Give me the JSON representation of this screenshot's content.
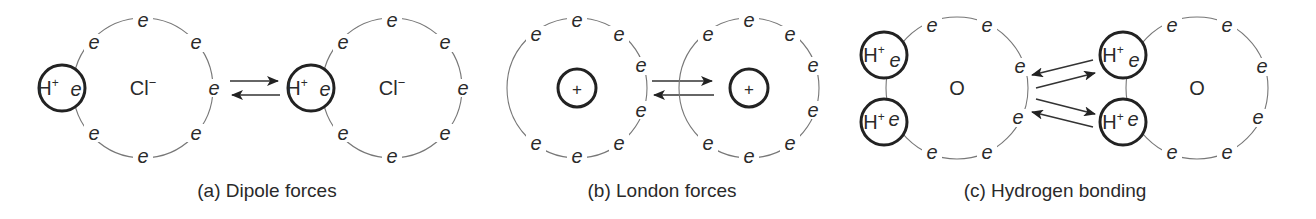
{
  "figure": {
    "panels": [
      {
        "id": "a",
        "caption": "(a) Dipole forces",
        "molecules": [
          {
            "core_label": "Cl−",
            "proton_label": "H+",
            "electron_label": "e"
          },
          {
            "core_label": "Cl−",
            "proton_label": "H+",
            "electron_label": "e"
          }
        ],
        "arrows": [
          "right",
          "left"
        ]
      },
      {
        "id": "b",
        "caption": "(b) London forces",
        "atoms": [
          {
            "nucleus_label": "+",
            "electron_label": "e"
          },
          {
            "nucleus_label": "+",
            "electron_label": "e"
          }
        ],
        "arrows": [
          "right",
          "left"
        ]
      },
      {
        "id": "c",
        "caption": "(c) Hydrogen bonding",
        "molecules": [
          {
            "core_label": "O",
            "proton_label": "H+",
            "electron_label": "e"
          },
          {
            "core_label": "O",
            "proton_label": "H+",
            "electron_label": "e"
          }
        ],
        "arrows": [
          "left",
          "right",
          "right",
          "left"
        ]
      }
    ],
    "symbols": {
      "electron": "e",
      "proton": "H",
      "plus": "+",
      "chloride": "Cl",
      "minus": "−",
      "oxygen": "O",
      "nucleus_plus": "+"
    },
    "colors": {
      "line": "#777777",
      "bold_line": "#222222",
      "text": "#2a2a2a",
      "background": "#ffffff"
    }
  }
}
